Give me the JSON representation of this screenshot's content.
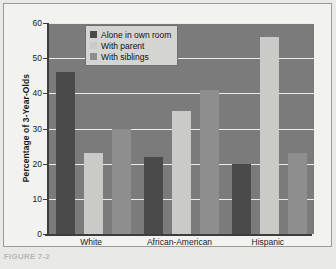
{
  "chart_data": {
    "type": "bar",
    "title": "",
    "xlabel": "",
    "ylabel": "Percentage of 3-Year-Olds",
    "ylim": [
      0,
      60
    ],
    "yticks": [
      0,
      10,
      20,
      30,
      40,
      50,
      60
    ],
    "grid": true,
    "legend_position": "top-left-inside",
    "categories": [
      "White",
      "African-American",
      "Hispanic"
    ],
    "series": [
      {
        "name": "Alone in own room",
        "color": "#4a4a4a",
        "values": [
          46,
          22,
          20
        ]
      },
      {
        "name": "With parent",
        "color": "#cacac8",
        "values": [
          23,
          35,
          56
        ]
      },
      {
        "name": "With siblings",
        "color": "#8e8e8e",
        "values": [
          30,
          41,
          23
        ]
      }
    ]
  },
  "legend": {
    "items": [
      {
        "label": "Alone in own room"
      },
      {
        "label": "With parent"
      },
      {
        "label": "With siblings"
      }
    ]
  },
  "axes": {
    "ytick_labels": [
      "60",
      "50",
      "40",
      "30",
      "20",
      "10",
      "0"
    ],
    "xtick_labels": [
      "White",
      "African-American",
      "Hispanic"
    ]
  },
  "caption": {
    "text": "FIGURE 7-2"
  },
  "colors": {
    "plot_background": "#7b7b7b",
    "figure_background": "#f2f2f0",
    "gridline": "#ececeb",
    "axis": "#3d3d3d",
    "series_dark": "#4a4a4a",
    "series_light": "#cacac8",
    "series_medium": "#8e8e8e"
  }
}
